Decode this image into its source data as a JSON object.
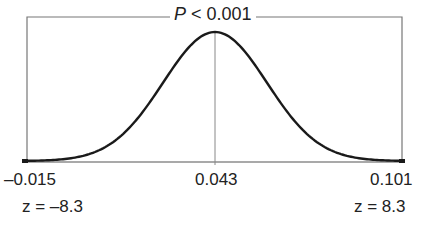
{
  "chart_data": {
    "type": "line",
    "title": "P < 0.001",
    "title_parts": {
      "symbol": "P",
      "rest": " < 0.001"
    },
    "xlabel": "",
    "ylabel": "",
    "x_ticks": [
      "–0.015",
      "0.043",
      "0.101"
    ],
    "z_labels": [
      "z = –8.3",
      "z = 8.3"
    ],
    "center": 0.043,
    "xlim": [
      -0.015,
      0.101
    ],
    "z_range": [
      -8.3,
      8.3
    ],
    "grid": false,
    "legend": null
  }
}
